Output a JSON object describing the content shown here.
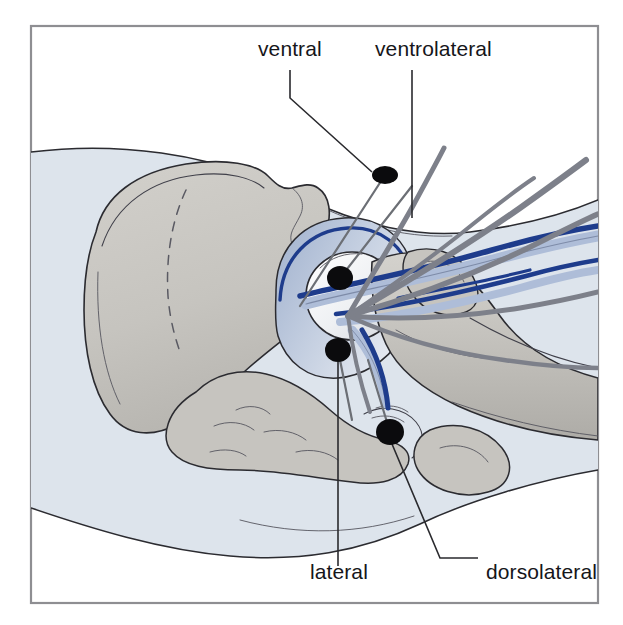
{
  "figure": {
    "kind": "anatomical-illustration",
    "view": "lateral view of right hip with femur and pelvis",
    "frame": {
      "border_color": "#8e8e92",
      "background_color": "#ffffff"
    },
    "palette": {
      "body_soft_tissue": "#dde4ec",
      "bone": "#c9c7c2",
      "bone_shadow": "#b4b2ad",
      "femoral_head": "#f2f3f5",
      "artery_blue_light": "#aebdd8",
      "vein_blue_dark": "#1e3c8c",
      "nerve_gray": "#7d808a",
      "outline": "#2b2b30",
      "marker_dot": "#0b0b0d",
      "label_text": "#16161a"
    },
    "labels": [
      {
        "id": "ventral",
        "text": "ventral",
        "position": "top-left",
        "x": 258,
        "y": 56,
        "marker_x": 385,
        "marker_y": 175
      },
      {
        "id": "ventrolateral",
        "text": "ventrolateral",
        "position": "top-right",
        "x": 375,
        "y": 56,
        "marker_x": 340,
        "marker_y": 278
      },
      {
        "id": "lateral",
        "text": "lateral",
        "position": "bottom-left",
        "x": 310,
        "y": 579,
        "marker_x": 338,
        "marker_y": 350
      },
      {
        "id": "dorsolateral",
        "text": "dorsolateral",
        "position": "bottom-right",
        "x": 486,
        "y": 579,
        "marker_x": 390,
        "marker_y": 432
      }
    ],
    "puncture_points": [
      {
        "id": "ventral",
        "cx": 385,
        "cy": 175,
        "rx": 13,
        "ry": 9
      },
      {
        "id": "ventrolateral",
        "cx": 340,
        "cy": 278,
        "rx": 13,
        "ry": 12
      },
      {
        "id": "lateral",
        "cx": 338,
        "cy": 350,
        "rx": 13,
        "ry": 12
      },
      {
        "id": "dorsolateral",
        "cx": 390,
        "cy": 432,
        "rx": 14,
        "ry": 13
      }
    ],
    "structures": [
      "iliac bone (ilium)",
      "acetabulum",
      "femoral head",
      "femoral neck",
      "greater trochanter",
      "femoral shaft",
      "ischial tuberosity",
      "pubic ramus",
      "femoral artery",
      "femoral vein",
      "femoral nerve branches",
      "soft tissue silhouette"
    ]
  }
}
